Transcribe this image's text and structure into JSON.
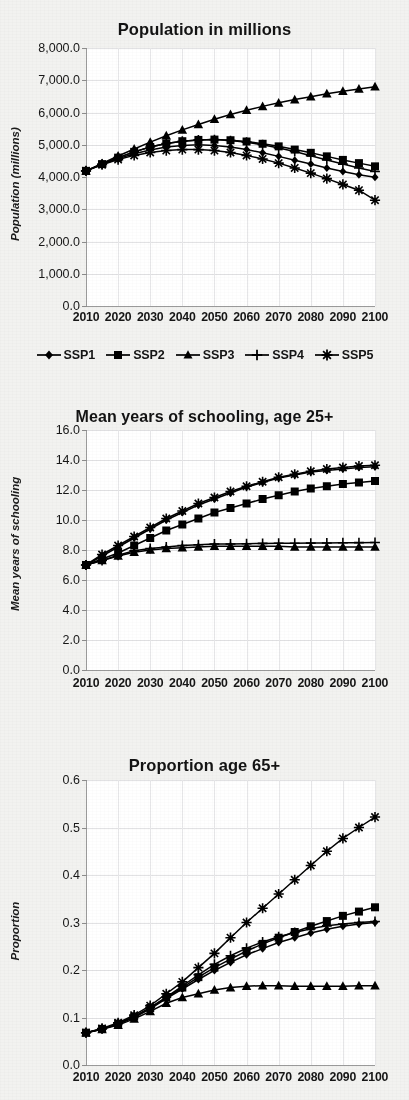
{
  "figure": {
    "background_color": "#f2f2f0",
    "plot_background_color": "#ffffff",
    "series_color": "#000000",
    "gridline_color": "#e2e2e4"
  },
  "legend": {
    "position": "below-first-chart",
    "items": [
      {
        "label": "SSP1",
        "marker": "diamond"
      },
      {
        "label": "SSP2",
        "marker": "square"
      },
      {
        "label": "SSP3",
        "marker": "triangle"
      },
      {
        "label": "SSP4",
        "marker": "plus"
      },
      {
        "label": "SSP5",
        "marker": "asterisk"
      }
    ]
  },
  "chart_data": [
    {
      "type": "line",
      "id": "population",
      "title": "Population in millions",
      "xlabel": "",
      "ylabel": "Population (millions)",
      "x": [
        2010,
        2015,
        2020,
        2025,
        2030,
        2035,
        2040,
        2045,
        2050,
        2055,
        2060,
        2065,
        2070,
        2075,
        2080,
        2085,
        2090,
        2095,
        2100
      ],
      "xticklabels": [
        "2010",
        "2020",
        "2030",
        "2040",
        "2050",
        "2060",
        "2070",
        "2080",
        "2090",
        "2100"
      ],
      "xlim": [
        2010,
        2100
      ],
      "ylim": [
        0,
        8000
      ],
      "yticklabels": [
        "0.0",
        "1,000.0",
        "2,000.0",
        "3,000.0",
        "4,000.0",
        "5,000.0",
        "6,000.0",
        "7,000.0",
        "8,000.0"
      ],
      "ytickvalues": [
        0,
        1000,
        2000,
        3000,
        4000,
        5000,
        6000,
        7000,
        8000
      ],
      "grid": true,
      "legend": true,
      "series": [
        {
          "name": "SSP1",
          "marker": "diamond",
          "values": [
            4190,
            4390,
            4570,
            4720,
            4840,
            4930,
            4980,
            5000,
            4980,
            4930,
            4850,
            4750,
            4640,
            4520,
            4400,
            4280,
            4170,
            4070,
            3990
          ]
        },
        {
          "name": "SSP2",
          "marker": "square",
          "values": [
            4190,
            4400,
            4600,
            4780,
            4930,
            5040,
            5110,
            5150,
            5160,
            5140,
            5100,
            5030,
            4950,
            4850,
            4750,
            4640,
            4530,
            4430,
            4330
          ]
        },
        {
          "name": "SSP3",
          "marker": "triangle",
          "values": [
            4190,
            4420,
            4650,
            4870,
            5080,
            5280,
            5460,
            5630,
            5790,
            5940,
            6070,
            6190,
            6300,
            6400,
            6490,
            6580,
            6660,
            6730,
            6800
          ]
        },
        {
          "name": "SSP4",
          "marker": "plus",
          "values": [
            4190,
            4400,
            4600,
            4780,
            4930,
            5040,
            5110,
            5150,
            5160,
            5130,
            5080,
            5000,
            4900,
            4790,
            4660,
            4530,
            4400,
            4280,
            4170
          ]
        },
        {
          "name": "SSP5",
          "marker": "asterisk",
          "values": [
            4190,
            4380,
            4540,
            4670,
            4760,
            4820,
            4850,
            4850,
            4820,
            4760,
            4670,
            4560,
            4430,
            4280,
            4120,
            3950,
            3770,
            3590,
            3280
          ]
        }
      ]
    },
    {
      "type": "line",
      "id": "schooling",
      "title": "Mean years of schooling, age 25+",
      "xlabel": "",
      "ylabel": "Mean years of schooling",
      "x": [
        2010,
        2015,
        2020,
        2025,
        2030,
        2035,
        2040,
        2045,
        2050,
        2055,
        2060,
        2065,
        2070,
        2075,
        2080,
        2085,
        2090,
        2095,
        2100
      ],
      "xticklabels": [
        "2010",
        "2020",
        "2030",
        "2040",
        "2050",
        "2060",
        "2070",
        "2080",
        "2090",
        "2100"
      ],
      "xlim": [
        2010,
        2100
      ],
      "ylim": [
        0,
        16
      ],
      "yticklabels": [
        "0.0",
        "2.0",
        "4.0",
        "6.0",
        "8.0",
        "10.0",
        "12.0",
        "14.0",
        "16.0"
      ],
      "ytickvalues": [
        0,
        2,
        4,
        6,
        8,
        10,
        12,
        14,
        16
      ],
      "grid": true,
      "legend": false,
      "series": [
        {
          "name": "SSP1",
          "marker": "diamond",
          "values": [
            7.0,
            7.6,
            8.2,
            8.8,
            9.4,
            10.0,
            10.5,
            11.0,
            11.4,
            11.8,
            12.2,
            12.5,
            12.8,
            13.0,
            13.2,
            13.3,
            13.4,
            13.5,
            13.55
          ]
        },
        {
          "name": "SSP2",
          "marker": "square",
          "values": [
            7.0,
            7.4,
            7.8,
            8.3,
            8.8,
            9.3,
            9.7,
            10.1,
            10.5,
            10.8,
            11.1,
            11.4,
            11.65,
            11.9,
            12.1,
            12.25,
            12.4,
            12.5,
            12.6
          ]
        },
        {
          "name": "SSP3",
          "marker": "triangle",
          "values": [
            7.0,
            7.3,
            7.6,
            7.85,
            8.0,
            8.1,
            8.15,
            8.2,
            8.25,
            8.25,
            8.25,
            8.25,
            8.25,
            8.2,
            8.2,
            8.2,
            8.2,
            8.2,
            8.2
          ]
        },
        {
          "name": "SSP4",
          "marker": "plus",
          "values": [
            7.0,
            7.3,
            7.65,
            7.95,
            8.1,
            8.2,
            8.3,
            8.35,
            8.4,
            8.4,
            8.42,
            8.44,
            8.45,
            8.45,
            8.46,
            8.47,
            8.48,
            8.49,
            8.5
          ]
        },
        {
          "name": "SSP5",
          "marker": "asterisk",
          "values": [
            7.0,
            7.7,
            8.3,
            8.9,
            9.5,
            10.1,
            10.6,
            11.1,
            11.5,
            11.9,
            12.25,
            12.55,
            12.85,
            13.05,
            13.25,
            13.4,
            13.5,
            13.6,
            13.65
          ]
        }
      ]
    },
    {
      "type": "line",
      "id": "proportion65",
      "title": "Proportion age 65+",
      "xlabel": "",
      "ylabel": "Proportion",
      "x": [
        2010,
        2015,
        2020,
        2025,
        2030,
        2035,
        2040,
        2045,
        2050,
        2055,
        2060,
        2065,
        2070,
        2075,
        2080,
        2085,
        2090,
        2095,
        2100
      ],
      "xticklabels": [
        "2010",
        "2020",
        "2030",
        "2040",
        "2050",
        "2060",
        "2070",
        "2080",
        "2090",
        "2100"
      ],
      "xlim": [
        2010,
        2100
      ],
      "ylim": [
        0,
        0.6
      ],
      "yticklabels": [
        "0.0",
        "0.1",
        "0.2",
        "0.3",
        "0.4",
        "0.5",
        "0.6"
      ],
      "ytickvalues": [
        0,
        0.1,
        0.2,
        0.3,
        0.4,
        0.5,
        0.6
      ],
      "grid": true,
      "legend": false,
      "series": [
        {
          "name": "SSP1",
          "marker": "diamond",
          "values": [
            0.068,
            0.075,
            0.086,
            0.1,
            0.118,
            0.14,
            0.16,
            0.18,
            0.199,
            0.216,
            0.232,
            0.245,
            0.258,
            0.268,
            0.278,
            0.286,
            0.292,
            0.297,
            0.3
          ]
        },
        {
          "name": "SSP2",
          "marker": "square",
          "values": [
            0.068,
            0.076,
            0.087,
            0.102,
            0.12,
            0.142,
            0.163,
            0.185,
            0.205,
            0.223,
            0.24,
            0.255,
            0.268,
            0.28,
            0.292,
            0.303,
            0.314,
            0.323,
            0.332
          ]
        },
        {
          "name": "SSP3",
          "marker": "triangle",
          "values": [
            0.068,
            0.075,
            0.084,
            0.097,
            0.113,
            0.13,
            0.142,
            0.15,
            0.158,
            0.163,
            0.166,
            0.167,
            0.167,
            0.166,
            0.166,
            0.166,
            0.166,
            0.167,
            0.167
          ]
        },
        {
          "name": "SSP4",
          "marker": "plus",
          "values": [
            0.068,
            0.076,
            0.087,
            0.102,
            0.121,
            0.143,
            0.166,
            0.19,
            0.212,
            0.23,
            0.246,
            0.259,
            0.27,
            0.279,
            0.287,
            0.293,
            0.297,
            0.3,
            0.302
          ]
        },
        {
          "name": "SSP5",
          "marker": "asterisk",
          "values": [
            0.068,
            0.077,
            0.089,
            0.105,
            0.125,
            0.15,
            0.175,
            0.205,
            0.235,
            0.268,
            0.3,
            0.33,
            0.36,
            0.39,
            0.42,
            0.45,
            0.477,
            0.5,
            0.522
          ]
        }
      ]
    }
  ]
}
